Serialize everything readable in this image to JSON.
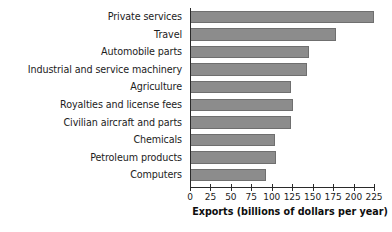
{
  "chart_data": {
    "type": "bar",
    "orientation": "horizontal",
    "title": "",
    "xlabel": "Exports (billions of dollars per year)",
    "ylabel": "",
    "categories": [
      "Private services",
      "Travel",
      "Automobile parts",
      "Industrial and service machinery",
      "Agriculture",
      "Royalties and license fees",
      "Civilian aircraft and parts",
      "Chemicals",
      "Petroleum products",
      "Computers"
    ],
    "values": [
      225,
      178,
      145,
      143,
      124,
      126,
      124,
      104,
      105,
      93
    ],
    "xlim": [
      0,
      225
    ],
    "ylim": [
      0,
      10
    ],
    "xticks": [
      0,
      25,
      50,
      75,
      100,
      125,
      150,
      175,
      200,
      225
    ],
    "xtick_labels": [
      "0",
      "25",
      "50",
      "75",
      "100",
      "125",
      "150",
      "175",
      "200",
      "225"
    ],
    "grid": false,
    "legend": false,
    "bar_color": "#8c8c8c",
    "bar_edge_color": "#6f6f6f",
    "axis_color": "#2a2a2a",
    "background_color": "#ffffff"
  }
}
